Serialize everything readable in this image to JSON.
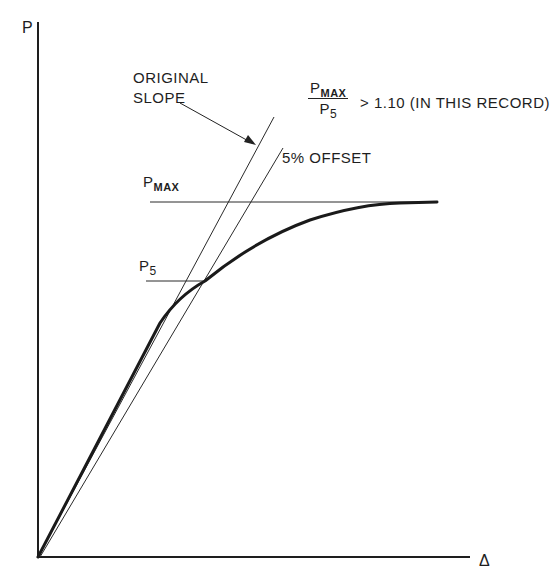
{
  "diagram": {
    "y_axis_label": "P",
    "x_axis_label": "Δ",
    "original_slope_annotation": {
      "line1": "ORIGINAL",
      "line2": "SLOPE"
    },
    "offset_annotation": "5% OFFSET",
    "pmax_label": {
      "base": "P",
      "sub": "MAX"
    },
    "p5_label": {
      "base": "P",
      "sub": "5"
    },
    "ratio_note": {
      "numerator_base": "P",
      "numerator_sub": "MAX",
      "denominator_base": "P",
      "denominator_sub": "5",
      "relation": "> 1.10 (IN THIS RECORD)"
    },
    "elements": [
      "load-deflection curve",
      "original slope line",
      "5% offset line",
      "P_MAX horizontal level",
      "P_5 horizontal level"
    ],
    "colors": {
      "ink": "#1e1e1e",
      "background": "#ffffff"
    }
  }
}
